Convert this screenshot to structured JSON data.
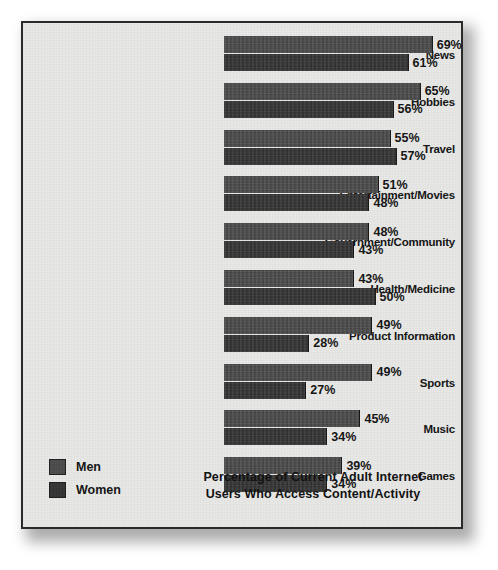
{
  "chart_data": {
    "type": "bar",
    "orientation": "horizontal",
    "title_lines": [
      "Percentage of Current Adult Internet",
      "Users Who Access Content/Activity"
    ],
    "xlabel": "",
    "ylabel": "",
    "xlim": [
      0,
      69
    ],
    "grid": false,
    "legend_position": "bottom-left",
    "value_suffix": "%",
    "categories": [
      "News",
      "Hobbies",
      "Travel",
      "Entertainment/Movies",
      "Government/Community",
      "Health/Medicine",
      "Product Information",
      "Sports",
      "Music",
      "Games"
    ],
    "series": [
      {
        "name": "Men",
        "color": "#4a4a4a",
        "values": [
          69,
          65,
          55,
          51,
          48,
          43,
          49,
          49,
          45,
          39
        ],
        "labels": [
          "69%",
          "65%",
          "55%",
          "51%",
          "48%",
          "43%",
          "49%",
          "49%",
          "45%",
          "39%"
        ]
      },
      {
        "name": "Women",
        "color": "#333333",
        "values": [
          61,
          56,
          57,
          48,
          43,
          50,
          28,
          27,
          34,
          34
        ],
        "labels": [
          "61%",
          "56%",
          "57%",
          "48%",
          "43%",
          "50%",
          "28%",
          "27%",
          "34%",
          "34%"
        ]
      }
    ]
  },
  "legend": {
    "items": [
      {
        "label": "Men",
        "color": "#4a4a4a"
      },
      {
        "label": "Women",
        "color": "#333333"
      }
    ]
  },
  "panel": {
    "background": "#e8e8e6",
    "border_color": "#2a2a2a"
  }
}
